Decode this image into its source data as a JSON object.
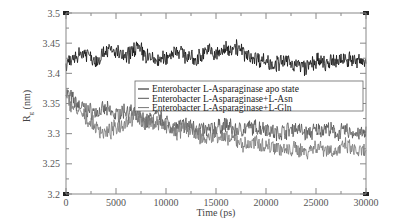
{
  "chart_data": {
    "type": "line",
    "title": "",
    "xlabel": "Time (ps)",
    "ylabel": "Rg (nm)",
    "xlim": [
      0,
      30000
    ],
    "ylim": [
      3.2,
      3.5
    ],
    "x_ticks": [
      0,
      5000,
      10000,
      15000,
      20000,
      25000,
      30000
    ],
    "x_tick_labels": [
      "0",
      "5000",
      "10000",
      "15000",
      "20000",
      "25000",
      "30000"
    ],
    "y_ticks": [
      3.2,
      3.25,
      3.3,
      3.35,
      3.4,
      3.45,
      3.5
    ],
    "y_tick_labels": [
      "3.2",
      "3.25",
      "3.3",
      "3.35",
      "3.4",
      "3.45",
      "3.5"
    ],
    "grid": false,
    "legend_position": "center-right (inside plot)",
    "x": [
      0,
      1000,
      2000,
      3000,
      4000,
      5000,
      6000,
      7000,
      8000,
      9000,
      10000,
      11000,
      12000,
      13000,
      14000,
      15000,
      16000,
      17000,
      18000,
      19000,
      20000,
      21000,
      22000,
      23000,
      24000,
      25000,
      26000,
      27000,
      28000,
      29000,
      30000
    ],
    "series": [
      {
        "name": "Enterobacter L-Asparaginase apo state",
        "color": "#111111",
        "values": [
          3.41,
          3.43,
          3.435,
          3.42,
          3.44,
          3.435,
          3.425,
          3.445,
          3.43,
          3.42,
          3.425,
          3.44,
          3.43,
          3.42,
          3.44,
          3.43,
          3.44,
          3.445,
          3.43,
          3.425,
          3.42,
          3.415,
          3.42,
          3.415,
          3.41,
          3.42,
          3.415,
          3.42,
          3.425,
          3.42,
          3.42
        ]
      },
      {
        "name": "Enterobacter L-Asparaginase+L-Asn",
        "color": "#555555",
        "values": [
          3.37,
          3.35,
          3.34,
          3.335,
          3.34,
          3.33,
          3.34,
          3.33,
          3.32,
          3.33,
          3.32,
          3.31,
          3.315,
          3.31,
          3.305,
          3.31,
          3.315,
          3.305,
          3.31,
          3.31,
          3.31,
          3.3,
          3.305,
          3.31,
          3.3,
          3.305,
          3.31,
          3.3,
          3.305,
          3.3,
          3.3
        ]
      },
      {
        "name": "Enterobacter L-Asparaginase+L-Gln",
        "color": "#777777",
        "values": [
          3.36,
          3.34,
          3.325,
          3.31,
          3.3,
          3.31,
          3.32,
          3.33,
          3.315,
          3.32,
          3.31,
          3.3,
          3.31,
          3.3,
          3.29,
          3.3,
          3.29,
          3.29,
          3.28,
          3.285,
          3.28,
          3.28,
          3.27,
          3.275,
          3.27,
          3.28,
          3.275,
          3.27,
          3.28,
          3.27,
          3.27
        ]
      }
    ]
  },
  "axes": {
    "xlabel": "Time (ps)",
    "ylabel_main": "R",
    "ylabel_sub": "g",
    "ylabel_unit": " (nm)"
  },
  "legend": {
    "items": [
      {
        "label": "Enterobacter L-Asparaginase apo state",
        "color": "#111111"
      },
      {
        "label": "Enterobacter L-Asparaginase+L-Asn",
        "color": "#555555"
      },
      {
        "label": "Enterobacter L-Asparaginase+L-Gln",
        "color": "#777777"
      }
    ]
  }
}
